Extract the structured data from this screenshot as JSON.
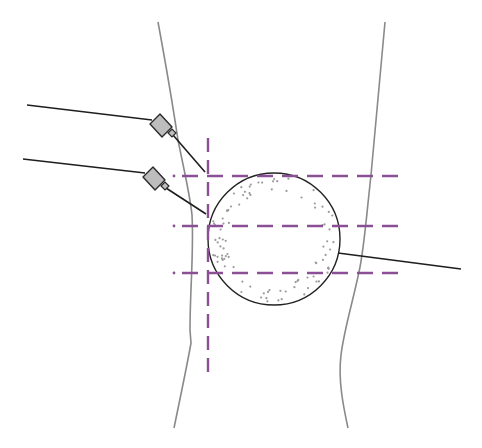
{
  "diagram": {
    "width": 482,
    "height": 448,
    "colors": {
      "background": "#ffffff",
      "contour": "#8a8a8a",
      "wire": "#1e1e1e",
      "guide": "#8b4f96",
      "hub_fill": "#bdbdbd",
      "hub_stroke": "#2a2a2a",
      "stipple": "#9a9a9a",
      "circle": "#222222"
    },
    "leg_contours": {
      "left": "M158,22 C165,60 172,100 178,140 C184,170 190,195 192,215 C194,250 190,290 190,330 L191,343 C188,360 184,380 174,428",
      "right": "M385,22 C380,80 375,130 371,175 C366,220 364,250 359,272 C352,305 344,330 341,355 C338,380 343,405 348,428"
    },
    "patella": {
      "cx": 274,
      "cy": 239,
      "r": 66
    },
    "guides": {
      "vertical": {
        "x": 208,
        "y1": 138,
        "y2": 374
      },
      "horizontal": [
        {
          "y": 176,
          "x1": 174,
          "x2": 406
        },
        {
          "y": 226,
          "x1": 174,
          "x2": 406
        },
        {
          "y": 273,
          "x1": 174,
          "x2": 406
        }
      ]
    },
    "needles": [
      {
        "name": "upper-needle",
        "wire": [
          [
            27,
            105
          ],
          [
            152,
            120
          ]
        ],
        "hub": "150,124 160,114 172,127 162,137",
        "tip": "168,133 172,129 176,133 172,137",
        "shaft": [
          [
            173,
            135
          ],
          [
            205,
            172
          ]
        ]
      },
      {
        "name": "lower-needle",
        "wire": [
          [
            23,
            159
          ],
          [
            145,
            173
          ]
        ],
        "hub": "143,177 153,167 165,180 155,190",
        "tip": "161,186 165,182 169,186 165,190",
        "shaft": [
          [
            166,
            188
          ],
          [
            206,
            214
          ]
        ]
      }
    ],
    "electrode_wire": [
      [
        338,
        253
      ],
      [
        461,
        269
      ]
    ]
  }
}
